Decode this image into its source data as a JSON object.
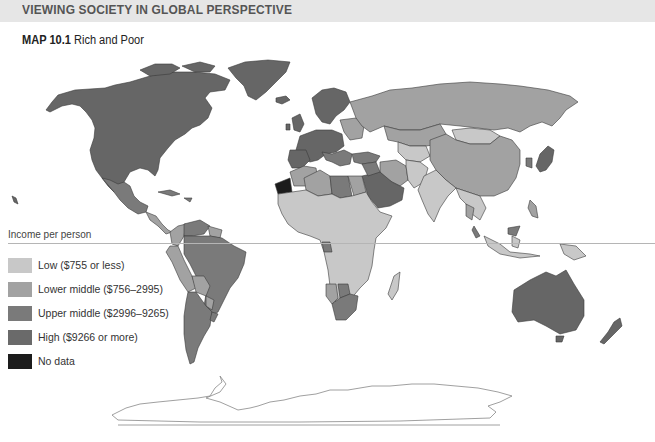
{
  "header": {
    "section_title": "VIEWING SOCIETY IN GLOBAL PERSPECTIVE"
  },
  "map": {
    "title_bold": "MAP 10.1",
    "title_text": "Rich and Poor"
  },
  "legend": {
    "heading": "Income per person",
    "items": [
      {
        "label": "Low ($755 or less)",
        "color": "#c8c8c8"
      },
      {
        "label": "Lower middle ($756–2995)",
        "color": "#a2a2a2"
      },
      {
        "label": "Upper middle ($2996–9265)",
        "color": "#7a7a7a"
      },
      {
        "label": "High ($9266 or more)",
        "color": "#6a6a6a"
      },
      {
        "label": "No data",
        "color": "#1c1c1c"
      }
    ]
  },
  "colors": {
    "low": "#c8c8c8",
    "lower_middle": "#a2a2a2",
    "upper_middle": "#7a7a7a",
    "high": "#666666",
    "no_data": "#1c1c1c",
    "border": "#3a3a3a",
    "header_band": "#e6e6e6"
  }
}
